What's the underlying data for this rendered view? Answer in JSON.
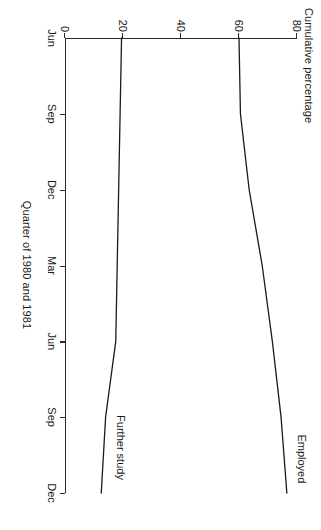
{
  "chart_data": {
    "type": "line",
    "title": "",
    "xlabel": "Quarter of 1980 and 1981",
    "ylabel": "Cumulative percentage",
    "x": [
      "Jun",
      "Sep",
      "Dec",
      "Mar",
      "Jun",
      "Sep",
      "Dec"
    ],
    "xticks": [
      "Jun",
      "Sep",
      "Dec",
      "Mar",
      "Jun",
      "Sep",
      "Dec"
    ],
    "yticks": [
      0,
      20,
      40,
      60,
      80
    ],
    "ylim": [
      0,
      80
    ],
    "grid": false,
    "legend": "inline-labels",
    "series": [
      {
        "name": "Employed",
        "label": "Employed",
        "values": [
          60,
          60.5,
          63.5,
          68,
          71.5,
          74.5,
          76.5
        ],
        "color": "#1a1a1a"
      },
      {
        "name": "Further study",
        "label": "Further study",
        "values": [
          19.5,
          19,
          18.5,
          18,
          17.5,
          14,
          12.5
        ],
        "color": "#1a1a1a"
      }
    ]
  },
  "figure": {
    "y_axis_title": "Cumulative percentage",
    "x_axis_title": "Quarter of 1980 and 1981",
    "y_tick_labels": [
      "0",
      "20",
      "40",
      "60",
      "80"
    ],
    "x_tick_labels": [
      "Jun",
      "Sep",
      "Dec",
      "Mar",
      "Jun",
      "Sep",
      "Dec"
    ],
    "series_labels": [
      "Employed",
      "Further study"
    ],
    "line_color": "#1a1a1a",
    "axis_color": "#2a2a2a",
    "background_color": "#ffffff"
  }
}
